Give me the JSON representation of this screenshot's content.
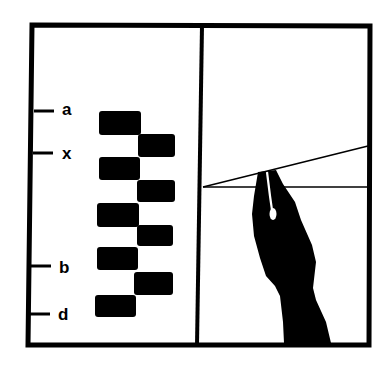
{
  "figure": {
    "panels": [
      {
        "id": "left",
        "description": "Stacked staggered black blocks with scale tick marks",
        "tick_labels": [
          {
            "label": "a",
            "y": 111
          },
          {
            "label": "x",
            "y": 153
          },
          {
            "label": "b",
            "y": 266
          },
          {
            "label": "d",
            "y": 314
          }
        ],
        "blocks": [
          {
            "x": 99,
            "y": 111,
            "w": 42,
            "h": 24
          },
          {
            "x": 138,
            "y": 134,
            "w": 37,
            "h": 23
          },
          {
            "x": 99,
            "y": 157,
            "w": 41,
            "h": 23
          },
          {
            "x": 137,
            "y": 180,
            "w": 38,
            "h": 22
          },
          {
            "x": 97,
            "y": 203,
            "w": 42,
            "h": 24
          },
          {
            "x": 137,
            "y": 225,
            "w": 36,
            "h": 21
          },
          {
            "x": 97,
            "y": 247,
            "w": 41,
            "h": 23
          },
          {
            "x": 134,
            "y": 272,
            "w": 39,
            "h": 23
          },
          {
            "x": 95,
            "y": 295,
            "w": 41,
            "h": 22
          }
        ]
      },
      {
        "id": "right",
        "description": "Pen nib touching intersection of a slanted and a horizontal line",
        "lines": [
          {
            "name": "slanted-line",
            "x1": 203,
            "y1": 187,
            "x2": 368,
            "y2": 146
          },
          {
            "name": "horizontal-line",
            "x1": 203,
            "y1": 187,
            "x2": 368,
            "y2": 187
          }
        ]
      }
    ],
    "colors": {
      "ink": "#000000",
      "paper": "#ffffff"
    }
  }
}
